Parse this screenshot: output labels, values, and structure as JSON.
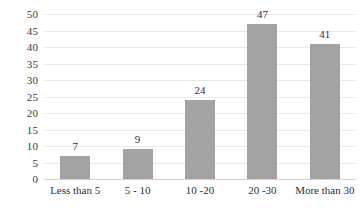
{
  "chart_data": {
    "type": "bar",
    "title": "",
    "subtitle": "",
    "xlabel": "",
    "ylabel": "",
    "categories": [
      "Less than 5",
      "5 - 10",
      "10 -20",
      "20 -30",
      "More than 30"
    ],
    "values": [
      7,
      9,
      24,
      47,
      41
    ],
    "data_labels": [
      "7",
      "9",
      "24",
      "47",
      "41"
    ],
    "ylim": [
      0,
      50
    ],
    "ytick_step": 5,
    "ytick_labels": [
      "50",
      "45",
      "40",
      "35",
      "30",
      "25",
      "20",
      "15",
      "10",
      "5",
      "0"
    ],
    "ytick_values": [
      50,
      45,
      40,
      35,
      30,
      25,
      20,
      15,
      10,
      5,
      0
    ],
    "grid": true,
    "grid_orientation": "horizontal",
    "legend": false,
    "legend_position": "none",
    "bar_color": "#a3a3a3",
    "gridline_color": "#e8e8e8",
    "axis_color": "#d2d2d2",
    "text_color": "#2f2f2f",
    "background_color": "#ffffff"
  }
}
